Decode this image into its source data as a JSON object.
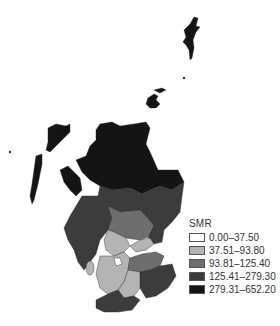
{
  "map": {
    "region": "Scotland",
    "shading_variable": "SMR",
    "colors": {
      "class1": "#ffffff",
      "class2": "#b4b4b4",
      "class3": "#6e6e6e",
      "class4": "#3c3c3c",
      "class5": "#141414",
      "border": "#222222"
    }
  },
  "legend": {
    "title": "SMR",
    "items": [
      {
        "label": "0.00–37.50",
        "color": "#ffffff"
      },
      {
        "label": "37.51–93.80",
        "color": "#b4b4b4"
      },
      {
        "label": "93.81–125.40",
        "color": "#6e6e6e"
      },
      {
        "label": "125.41–279.30",
        "color": "#3c3c3c"
      },
      {
        "label": "279.31–652.20",
        "color": "#141414"
      }
    ]
  }
}
